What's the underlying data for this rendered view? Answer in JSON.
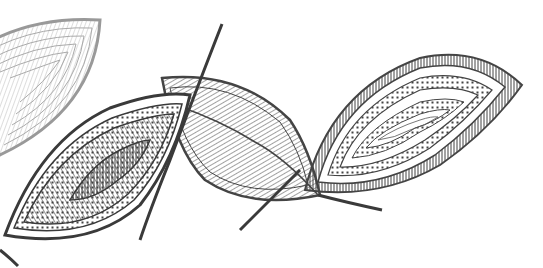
{
  "image": {
    "description": "Monochrome line-art illustration of four stylized leaves with hatched and dotted ornamental patterns",
    "width": 543,
    "height": 268,
    "colors": {
      "background": "#ffffff",
      "ink_dark": "#3a3a3a",
      "ink_mid": "#5a5a5a",
      "ink_light": "#9a9a9a"
    },
    "elements": [
      {
        "name": "faded-leaf-top-left",
        "style": "concentric arcs, light gray"
      },
      {
        "name": "dark-leaf-bottom-left",
        "style": "radiating hatch with dotted border"
      },
      {
        "name": "center-leaf-with-stem",
        "style": "parallel hatching, crossing stem"
      },
      {
        "name": "right-leaf",
        "style": "concentric dotted rings"
      }
    ]
  }
}
